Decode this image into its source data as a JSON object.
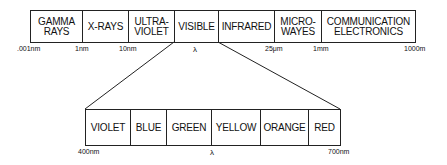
{
  "diagram": {
    "spectrum": {
      "bands": [
        {
          "label": "GAMMA\nRAYS",
          "x0": 30,
          "x1": 82
        },
        {
          "label": "X-RAYS",
          "x0": 82,
          "x1": 128
        },
        {
          "label": "ULTRA-\nVIOLET",
          "x0": 128,
          "x1": 174
        },
        {
          "label": "VISIBLE",
          "x0": 174,
          "x1": 218
        },
        {
          "label": "INFRARED",
          "x0": 218,
          "x1": 274
        },
        {
          "label": "MICRO-\nWAYES",
          "x0": 274,
          "x1": 321
        },
        {
          "label": "COMMUNICATION\nELECTRONICS",
          "x0": 321,
          "x1": 415
        }
      ],
      "ticks": [
        {
          "label": ".001nm",
          "x": 17
        },
        {
          "label": "1nm",
          "x": 75
        },
        {
          "label": "10nm",
          "x": 119
        },
        {
          "label": "λ",
          "x": 193
        },
        {
          "label": "25μm",
          "x": 265
        },
        {
          "label": "1mm",
          "x": 313
        },
        {
          "label": "1000m",
          "x": 404
        }
      ]
    },
    "visible": {
      "bands": [
        {
          "label": "VIOLET",
          "x0": 85,
          "x1": 130
        },
        {
          "label": "BLUE",
          "x0": 130,
          "x1": 166
        },
        {
          "label": "GREEN",
          "x0": 166,
          "x1": 211
        },
        {
          "label": "YELLOW",
          "x0": 211,
          "x1": 260
        },
        {
          "label": "ORANGE",
          "x0": 260,
          "x1": 308
        },
        {
          "label": "RED",
          "x0": 308,
          "x1": 340
        }
      ],
      "ticks": [
        {
          "label": "400nm",
          "x": 78
        },
        {
          "label": "λ",
          "x": 210
        },
        {
          "label": "700nm",
          "x": 328
        }
      ]
    }
  }
}
